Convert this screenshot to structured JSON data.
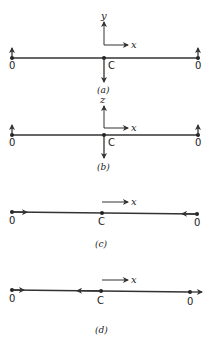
{
  "panels": [
    {
      "id": "a",
      "caption": "(a)",
      "axis_up_label": "y",
      "axis_right_label": "x",
      "left_end_label": "0",
      "center_label": "C",
      "right_end_label": "0",
      "description": "Transverse mode: ends displaced up, center displaced down"
    },
    {
      "id": "b",
      "caption": "(b)",
      "axis_up_label": "z",
      "axis_right_label": "x",
      "left_end_label": "0",
      "center_label": "C",
      "right_end_label": "0",
      "description": "Transverse mode in z: ends displaced up, center displaced down"
    },
    {
      "id": "c",
      "caption": "(c)",
      "axis_right_label": "x",
      "left_end_label": "0",
      "center_label": "C",
      "right_end_label": "0",
      "description": "Longitudinal mode: ends move inward, center stationary"
    },
    {
      "id": "d",
      "caption": "(d)",
      "axis_right_label": "x",
      "left_end_label": "0",
      "center_label": "C",
      "right_end_label": "0",
      "description": "Longitudinal mode: ends move right, center moves left"
    }
  ],
  "colors": {
    "ink": "#333333",
    "background": "#ffffff"
  }
}
